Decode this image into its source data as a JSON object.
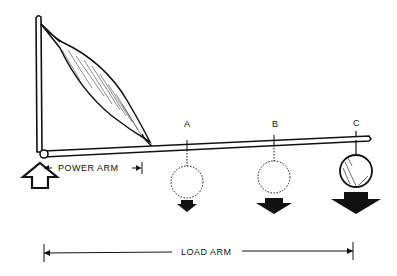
{
  "diagram": {
    "type": "lever-muscle",
    "labels": {
      "power_arm": "POWER ARM",
      "load_arm": "LOAD ARM",
      "point_a": "A",
      "point_b": "B",
      "point_c": "C"
    },
    "colors": {
      "ink": "#111111",
      "background": "#ffffff"
    },
    "icons": {
      "effort": "up-arrow-outline",
      "load_a": "down-arrow-filled-small",
      "load_b": "down-arrow-filled-medium",
      "load_c": "down-arrow-filled-large"
    }
  }
}
